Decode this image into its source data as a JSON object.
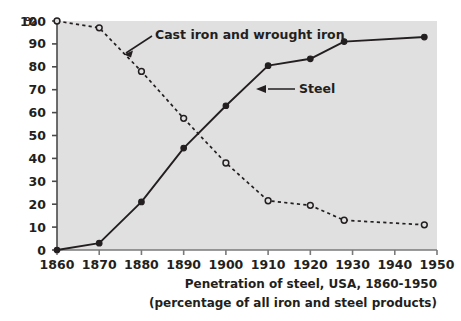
{
  "chart_data": {
    "type": "line",
    "title": "",
    "caption_line1": "Penetration of steel, USA, 1860-1950",
    "caption_line2": "(percentage of all iron and steel products)",
    "xlabel": "",
    "ylabel": "",
    "y_unit": "%",
    "xlim": [
      1860,
      1950
    ],
    "ylim": [
      0,
      100
    ],
    "xticks": [
      1860,
      1870,
      1880,
      1890,
      1900,
      1910,
      1920,
      1930,
      1940,
      1950
    ],
    "xtick_labels": [
      "1860",
      "1870",
      "1880",
      "1890",
      "1900",
      "1910",
      "1920",
      "1930",
      "1940",
      "1950"
    ],
    "yticks": [
      0,
      10,
      20,
      30,
      40,
      50,
      60,
      70,
      80,
      90,
      100
    ],
    "ytick_labels": [
      "0",
      "10",
      "20",
      "30",
      "40",
      "50",
      "60",
      "70",
      "80",
      "90",
      "100"
    ],
    "grid": false,
    "legend_position": "inline-annotations",
    "plot_bg_color": "#e0e0e0",
    "line_color": "#231f20",
    "series": [
      {
        "name": "Steel",
        "style": "solid",
        "marker": "filled-circle",
        "x": [
          1860,
          1870,
          1880,
          1890,
          1900,
          1910,
          1920,
          1928,
          1947
        ],
        "values": [
          0,
          3,
          21,
          44.5,
          63,
          80.5,
          83.5,
          91,
          93
        ]
      },
      {
        "name": "Cast iron and wrought iron",
        "style": "dashed",
        "marker": "open-circle",
        "x": [
          1860,
          1870,
          1880,
          1890,
          1900,
          1910,
          1920,
          1928,
          1947
        ],
        "values": [
          100,
          97,
          78,
          57.5,
          38,
          21.5,
          19.5,
          13,
          11
        ]
      }
    ],
    "annotations": [
      {
        "text": "Cast iron and wrought iron",
        "target_series": "Cast iron and wrought iron"
      },
      {
        "text": "Steel",
        "target_series": "Steel"
      }
    ]
  }
}
